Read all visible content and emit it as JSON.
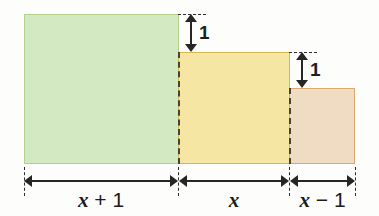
{
  "figure": {
    "background_color": "#fdfdfb"
  },
  "rectangles": [
    {
      "name": "green-rectangle",
      "fill": "#d2e9c2",
      "stroke": "#b5cf8e",
      "width_label": "x + 1"
    },
    {
      "name": "yellow-rectangle",
      "fill": "#f5e6a4",
      "stroke": "#d9b94e",
      "width_label": "x"
    },
    {
      "name": "orange-rectangle",
      "fill": "#f0dcc2",
      "stroke": "#dcab6c",
      "width_label": "x - 1"
    }
  ],
  "vertical_dimensions": [
    {
      "name": "gap-green-to-yellow",
      "label": "1"
    },
    {
      "name": "gap-yellow-to-orange",
      "label": "1"
    }
  ],
  "horizontal_dimensions": [
    {
      "name": "width-green",
      "variable": "x",
      "operator": "+",
      "operand": "1"
    },
    {
      "name": "width-yellow",
      "variable": "x",
      "operator": "",
      "operand": ""
    },
    {
      "name": "width-orange",
      "variable": "x",
      "operator": "−",
      "operand": "1"
    }
  ]
}
